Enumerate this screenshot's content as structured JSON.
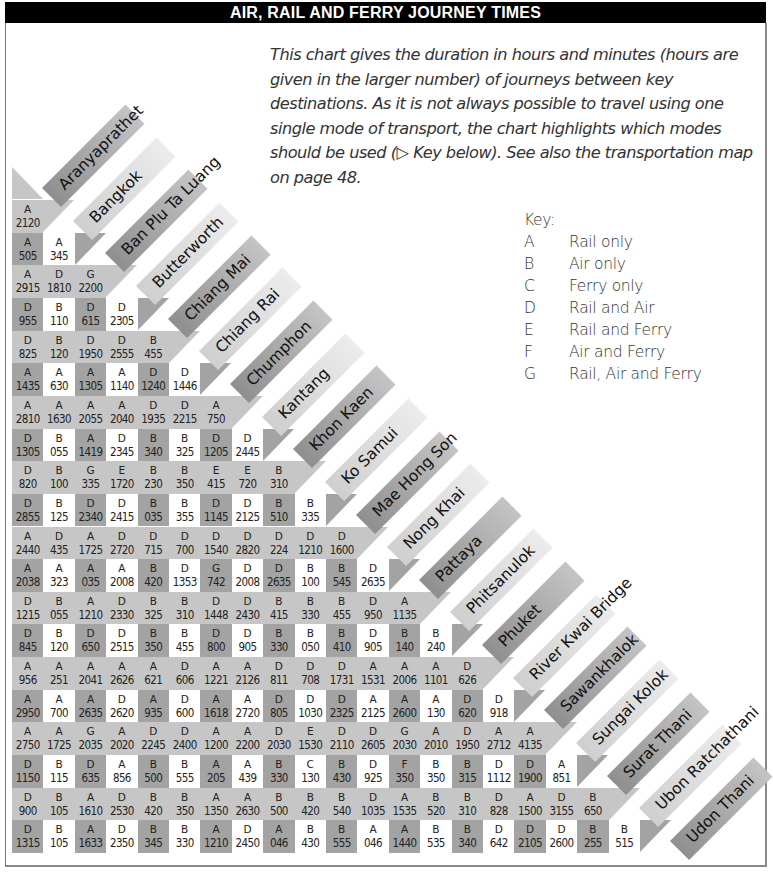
{
  "header": {
    "title": "AIR, RAIL AND FERRY JOURNEY TIMES"
  },
  "intro": {
    "text": "This chart gives the duration in hours and minutes (hours are given in the larger number) of journeys between key destinations. As it is not always possible to travel using one single mode of transport, the chart highlights which modes should be used (▷ Key below). See also the transportation map on page 48."
  },
  "key": {
    "title": "Key:",
    "items": [
      {
        "code": "A",
        "label": "Rail only"
      },
      {
        "code": "B",
        "label": "Air only"
      },
      {
        "code": "C",
        "label": "Ferry only"
      },
      {
        "code": "D",
        "label": "Rail and Air"
      },
      {
        "code": "E",
        "label": "Rail and Ferry"
      },
      {
        "code": "F",
        "label": "Air and Ferry"
      },
      {
        "code": "G",
        "label": "Rail, Air and Ferry"
      }
    ]
  },
  "destinations": [
    "Aranyaprathet",
    "Bangkok",
    "Ban Plu Ta Luang",
    "Butterworth",
    "Chiang Mai",
    "Chiang Rai",
    "Chumphon",
    "Kantang",
    "Khon Kaen",
    "Ko Samui",
    "Mae Hong Son",
    "Nong Khai",
    "Pattaya",
    "Phitsanulok",
    "Phuket",
    "River Kwai Bridge",
    "Sawankhalok",
    "Sungai Kolok",
    "Surat Thani",
    "Ubon Ratchathani",
    "Udon Thani"
  ],
  "colors": {
    "band": "#c6c6c6",
    "dark_cell": "#a3a3a3",
    "light_cell": "#ffffff",
    "label_dark": "#9a9a9a",
    "label_light": "#d4d4d4",
    "title_bg": "#000000"
  },
  "chart_data": {
    "type": "table",
    "title": "AIR, RAIL AND FERRY JOURNEY TIMES",
    "rows": [
      [
        [
          "A",
          "2120"
        ]
      ],
      [
        [
          "A",
          "505"
        ],
        [
          "A",
          "345"
        ]
      ],
      [
        [
          "A",
          "2915"
        ],
        [
          "D",
          "1810"
        ],
        [
          "G",
          "2200"
        ]
      ],
      [
        [
          "D",
          "955"
        ],
        [
          "B",
          "110"
        ],
        [
          "D",
          "615"
        ],
        [
          "D",
          "2305"
        ]
      ],
      [
        [
          "D",
          "825"
        ],
        [
          "B",
          "120"
        ],
        [
          "D",
          "1950"
        ],
        [
          "D",
          "2555"
        ],
        [
          "B",
          "455"
        ]
      ],
      [
        [
          "A",
          "1435"
        ],
        [
          "A",
          "630"
        ],
        [
          "A",
          "1305"
        ],
        [
          "A",
          "1140"
        ],
        [
          "D",
          "1240"
        ],
        [
          "D",
          "1446"
        ]
      ],
      [
        [
          "A",
          "2810"
        ],
        [
          "A",
          "1630"
        ],
        [
          "A",
          "2055"
        ],
        [
          "A",
          "2040"
        ],
        [
          "D",
          "1935"
        ],
        [
          "D",
          "2215"
        ],
        [
          "A",
          "750"
        ]
      ],
      [
        [
          "D",
          "1305"
        ],
        [
          "B",
          "055"
        ],
        [
          "A",
          "1419"
        ],
        [
          "D",
          "2345"
        ],
        [
          "B",
          "340"
        ],
        [
          "B",
          "325"
        ],
        [
          "D",
          "1205"
        ],
        [
          "D",
          "2445"
        ]
      ],
      [
        [
          "D",
          "820"
        ],
        [
          "B",
          "100"
        ],
        [
          "G",
          "335"
        ],
        [
          "E",
          "1720"
        ],
        [
          "B",
          "230"
        ],
        [
          "B",
          "350"
        ],
        [
          "E",
          "415"
        ],
        [
          "E",
          "720"
        ],
        [
          "B",
          "310"
        ]
      ],
      [
        [
          "D",
          "2855"
        ],
        [
          "B",
          "125"
        ],
        [
          "D",
          "2340"
        ],
        [
          "D",
          "2415"
        ],
        [
          "B",
          "035"
        ],
        [
          "B",
          "355"
        ],
        [
          "D",
          "1145"
        ],
        [
          "D",
          "2125"
        ],
        [
          "B",
          "510"
        ],
        [
          "B",
          "335"
        ]
      ],
      [
        [
          "A",
          "2440"
        ],
        [
          "D",
          "435"
        ],
        [
          "A",
          "1725"
        ],
        [
          "D",
          "2720"
        ],
        [
          "D",
          "715"
        ],
        [
          "D",
          "700"
        ],
        [
          "D",
          "1540"
        ],
        [
          "D",
          "2820"
        ],
        [
          "D",
          "224"
        ],
        [
          "D",
          "1210"
        ],
        [
          "D",
          "1600"
        ]
      ],
      [
        [
          "A",
          "2038"
        ],
        [
          "A",
          "323"
        ],
        [
          "A",
          "035"
        ],
        [
          "A",
          "2008"
        ],
        [
          "B",
          "420"
        ],
        [
          "D",
          "1353"
        ],
        [
          "G",
          "742"
        ],
        [
          "D",
          "2008"
        ],
        [
          "D",
          "2635"
        ],
        [
          "B",
          "100"
        ],
        [
          "B",
          "545"
        ],
        [
          "D",
          "2635"
        ]
      ],
      [
        [
          "D",
          "1215"
        ],
        [
          "B",
          "055"
        ],
        [
          "A",
          "1210"
        ],
        [
          "D",
          "2330"
        ],
        [
          "B",
          "325"
        ],
        [
          "B",
          "310"
        ],
        [
          "D",
          "1448"
        ],
        [
          "D",
          "2430"
        ],
        [
          "B",
          "415"
        ],
        [
          "B",
          "330"
        ],
        [
          "B",
          "455"
        ],
        [
          "D",
          "950"
        ],
        [
          "A",
          "1135"
        ]
      ],
      [
        [
          "D",
          "845"
        ],
        [
          "B",
          "120"
        ],
        [
          "D",
          "650"
        ],
        [
          "D",
          "2515"
        ],
        [
          "B",
          "350"
        ],
        [
          "B",
          "455"
        ],
        [
          "D",
          "800"
        ],
        [
          "D",
          "905"
        ],
        [
          "B",
          "330"
        ],
        [
          "B",
          "050"
        ],
        [
          "B",
          "410"
        ],
        [
          "D",
          "905"
        ],
        [
          "B",
          "140"
        ],
        [
          "B",
          "240"
        ]
      ],
      [
        [
          "A",
          "956"
        ],
        [
          "A",
          "251"
        ],
        [
          "A",
          "2041"
        ],
        [
          "A",
          "2626"
        ],
        [
          "A",
          "621"
        ],
        [
          "D",
          "606"
        ],
        [
          "A",
          "1221"
        ],
        [
          "A",
          "2126"
        ],
        [
          "D",
          "811"
        ],
        [
          "D",
          "708"
        ],
        [
          "D",
          "1731"
        ],
        [
          "A",
          "1531"
        ],
        [
          "A",
          "2006"
        ],
        [
          "A",
          "1101"
        ],
        [
          "D",
          "626"
        ]
      ],
      [
        [
          "A",
          "2950"
        ],
        [
          "A",
          "700"
        ],
        [
          "A",
          "2635"
        ],
        [
          "D",
          "2620"
        ],
        [
          "A",
          "935"
        ],
        [
          "D",
          "600"
        ],
        [
          "A",
          "1618"
        ],
        [
          "A",
          "2720"
        ],
        [
          "D",
          "805"
        ],
        [
          "D",
          "1030"
        ],
        [
          "D",
          "2325"
        ],
        [
          "A",
          "2125"
        ],
        [
          "A",
          "2600"
        ],
        [
          "A",
          "130"
        ],
        [
          "D",
          "620"
        ],
        [
          "D",
          "918"
        ]
      ],
      [
        [
          "A",
          "2750"
        ],
        [
          "A",
          "1725"
        ],
        [
          "G",
          "2035"
        ],
        [
          "A",
          "2020"
        ],
        [
          "D",
          "2245"
        ],
        [
          "D",
          "2400"
        ],
        [
          "A",
          "1200"
        ],
        [
          "A",
          "2200"
        ],
        [
          "D",
          "2030"
        ],
        [
          "E",
          "1530"
        ],
        [
          "D",
          "2110"
        ],
        [
          "D",
          "2605"
        ],
        [
          "G",
          "2030"
        ],
        [
          "A",
          "2010"
        ],
        [
          "D",
          "1950"
        ],
        [
          "A",
          "2712"
        ],
        [
          "A",
          "4135"
        ]
      ],
      [
        [
          "D",
          "1150"
        ],
        [
          "B",
          "115"
        ],
        [
          "D",
          "635"
        ],
        [
          "A",
          "856"
        ],
        [
          "B",
          "500"
        ],
        [
          "B",
          "555"
        ],
        [
          "A",
          "205"
        ],
        [
          "A",
          "439"
        ],
        [
          "B",
          "330"
        ],
        [
          "C",
          "130"
        ],
        [
          "B",
          "430"
        ],
        [
          "D",
          "925"
        ],
        [
          "F",
          "350"
        ],
        [
          "B",
          "350"
        ],
        [
          "B",
          "315"
        ],
        [
          "D",
          "1112"
        ],
        [
          "D",
          "1900"
        ],
        [
          "A",
          "851"
        ]
      ],
      [
        [
          "D",
          "900"
        ],
        [
          "B",
          "105"
        ],
        [
          "A",
          "1610"
        ],
        [
          "D",
          "2530"
        ],
        [
          "B",
          "420"
        ],
        [
          "B",
          "350"
        ],
        [
          "A",
          "1350"
        ],
        [
          "A",
          "2630"
        ],
        [
          "B",
          "500"
        ],
        [
          "B",
          "420"
        ],
        [
          "B",
          "540"
        ],
        [
          "D",
          "1035"
        ],
        [
          "A",
          "1535"
        ],
        [
          "B",
          "520"
        ],
        [
          "B",
          "310"
        ],
        [
          "D",
          "828"
        ],
        [
          "A",
          "1500"
        ],
        [
          "D",
          "3155"
        ],
        [
          "B",
          "650"
        ]
      ],
      [
        [
          "D",
          "1315"
        ],
        [
          "B",
          "105"
        ],
        [
          "A",
          "1633"
        ],
        [
          "D",
          "2350"
        ],
        [
          "B",
          "345"
        ],
        [
          "B",
          "330"
        ],
        [
          "A",
          "1210"
        ],
        [
          "D",
          "2450"
        ],
        [
          "A",
          "046"
        ],
        [
          "B",
          "430"
        ],
        [
          "B",
          "555"
        ],
        [
          "A",
          "046"
        ],
        [
          "A",
          "1440"
        ],
        [
          "B",
          "535"
        ],
        [
          "B",
          "340"
        ],
        [
          "D",
          "642"
        ],
        [
          "D",
          "2105"
        ],
        [
          "D",
          "2600"
        ],
        [
          "B",
          "255"
        ],
        [
          "B",
          "515"
        ]
      ]
    ]
  }
}
